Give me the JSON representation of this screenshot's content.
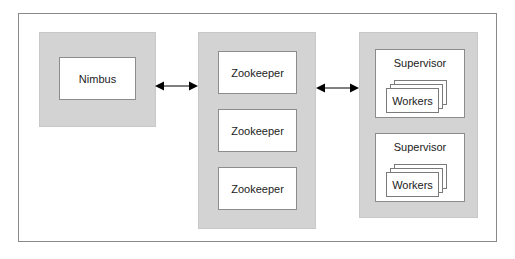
{
  "diagram": {
    "nimbus": {
      "label": "Nimbus"
    },
    "zookeepers": [
      {
        "label": "Zookeeper"
      },
      {
        "label": "Zookeeper"
      },
      {
        "label": "Zookeeper"
      }
    ],
    "supervisors": [
      {
        "label": "Supervisor",
        "workers_label": "Workers"
      },
      {
        "label": "Supervisor",
        "workers_label": "Workers"
      }
    ],
    "connections": [
      {
        "from": "Nimbus",
        "to": "Zookeeper cluster",
        "direction": "bidirectional"
      },
      {
        "from": "Zookeeper cluster",
        "to": "Supervisors",
        "direction": "bidirectional"
      }
    ],
    "colors": {
      "panel_fill": "#d3d3d3",
      "box_fill": "#ffffff",
      "border": "#8c8c8c",
      "arrow": "#000000"
    }
  }
}
